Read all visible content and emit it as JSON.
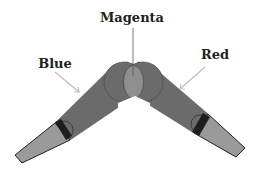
{
  "labels": {
    "magenta": "Magenta",
    "blue": "Blue",
    "red": "Red"
  },
  "colors": {
    "arm_fill": "#6b6b6b",
    "arm_stroke": "#555555",
    "tip_fill": "#9a9a9a",
    "tip_stroke": "#222222",
    "band_fill": "#1e1e1e",
    "overlap_fill": "#8f8f8f",
    "arrow": "#bdbdbd",
    "text": "#222222"
  }
}
